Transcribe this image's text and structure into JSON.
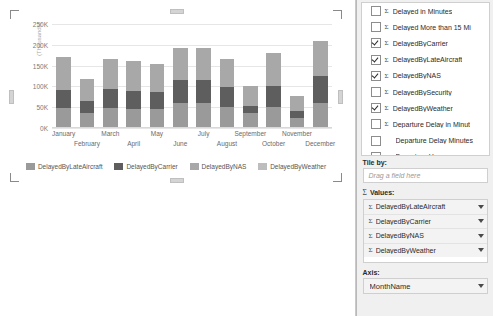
{
  "chart_data": {
    "type": "bar",
    "subtype": "stacked-column",
    "title": "",
    "xlabel": "",
    "ylabel": "(Thousands)",
    "ylim": [
      0,
      250000
    ],
    "ytick_labels": [
      "0K",
      "50K",
      "100K",
      "150K",
      "200K",
      "250K"
    ],
    "ytick_values": [
      0,
      50000,
      100000,
      150000,
      200000,
      250000
    ],
    "grid": true,
    "legend_position": "bottom",
    "categories": [
      "January",
      "February",
      "March",
      "April",
      "May",
      "June",
      "July",
      "August",
      "September",
      "October",
      "November",
      "December"
    ],
    "series": [
      {
        "name": "DelayedByLateAircraft",
        "color": "#9a9a9a",
        "values": [
          48000,
          36000,
          48000,
          46000,
          45000,
          60000,
          59000,
          50000,
          36000,
          50000,
          23000,
          60000
        ]
      },
      {
        "name": "DelayedByCarrier",
        "color": "#5e5e5e",
        "values": [
          44000,
          29000,
          45000,
          42000,
          42000,
          55000,
          56000,
          49000,
          18000,
          50000,
          17000,
          64000
        ]
      },
      {
        "name": "DelayedByNAS",
        "color": "#a8a8a8",
        "values": [
          78000,
          54000,
          74000,
          72000,
          67000,
          77000,
          77000,
          68000,
          46000,
          80000,
          38000,
          86000
        ]
      },
      {
        "name": "DelayedByWeather",
        "color": "#bdbdbd",
        "values": [
          0,
          0,
          0,
          0,
          0,
          0,
          0,
          0,
          0,
          0,
          0,
          0
        ]
      }
    ],
    "totals": [
      170000,
      119000,
      167000,
      160000,
      154000,
      192000,
      192000,
      167000,
      100000,
      180000,
      78000,
      210000
    ],
    "legend": [
      "DelayedByLateAircraft",
      "DelayedByCarrier",
      "DelayedByNAS",
      "DelayedByWeather"
    ]
  },
  "fields_pane": {
    "fields": [
      {
        "label": "Delayed in Minutes",
        "checked": false,
        "sigma": true,
        "indent": false
      },
      {
        "label": "Delayed More than 15 Mi",
        "checked": false,
        "sigma": true,
        "indent": false
      },
      {
        "label": "DelayedByCarrier",
        "checked": true,
        "sigma": true,
        "indent": false
      },
      {
        "label": "DelayedByLateAircraft",
        "checked": true,
        "sigma": true,
        "indent": false
      },
      {
        "label": "DelayedByNAS",
        "checked": true,
        "sigma": true,
        "indent": false
      },
      {
        "label": "DelayedBySecurity",
        "checked": false,
        "sigma": true,
        "indent": false
      },
      {
        "label": "DelayedByWeather",
        "checked": true,
        "sigma": true,
        "indent": false
      },
      {
        "label": "Departure Delay in Minut",
        "checked": false,
        "sigma": true,
        "indent": false
      },
      {
        "label": "Departure Delay Minutes",
        "checked": false,
        "sigma": false,
        "indent": true
      },
      {
        "label": "Departure Hour",
        "checked": false,
        "sigma": false,
        "indent": true
      },
      {
        "label": "DepartureDatesGroups",
        "checked": false,
        "sigma": false,
        "indent": true
      }
    ],
    "tile_by": {
      "label": "Tile by:",
      "placeholder": "Drag a field here",
      "value": ""
    },
    "values": {
      "label": "Values:",
      "sigma": "Σ",
      "items": [
        {
          "label": "DelayedByLateAircraft"
        },
        {
          "label": "DelayedByCarrier"
        },
        {
          "label": "DelayedByNAS"
        },
        {
          "label": "DelayedByWeather"
        }
      ]
    },
    "axis": {
      "label": "Axis:",
      "value": "MonthName"
    }
  },
  "icons": {
    "sigma": "Σ",
    "caret": "chevron-down-icon",
    "check": "check-icon"
  }
}
